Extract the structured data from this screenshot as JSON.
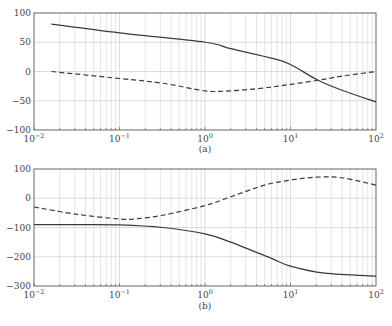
{
  "chart_data": [
    {
      "type": "line",
      "title": "",
      "caption": "(a)",
      "xlabel": "",
      "ylabel": "",
      "xscale": "log",
      "xlim": [
        0.01,
        100
      ],
      "ylim": [
        -100,
        100
      ],
      "grid": true,
      "x_tick_labels": [
        "10^-2",
        "10^-1",
        "10^0",
        "10^1",
        "10^2"
      ],
      "y_tick_labels": [
        "100",
        "50",
        "0",
        "-50",
        "-100"
      ],
      "y_ticks": [
        100,
        50,
        0,
        -50,
        -100
      ],
      "series": [
        {
          "name": "solid",
          "style": "solid",
          "x": [
            0.016,
            0.1,
            1,
            2,
            6.3,
            10,
            21,
            40,
            100
          ],
          "values": [
            81,
            66,
            50,
            39,
            22,
            12,
            -15,
            -32,
            -52
          ]
        },
        {
          "name": "dashed",
          "style": "dashed",
          "x": [
            0.016,
            0.1,
            0.32,
            1,
            2,
            5,
            10,
            21,
            40,
            100
          ],
          "values": [
            0,
            -12,
            -20,
            -33,
            -33,
            -28,
            -22,
            -15,
            -8,
            0
          ]
        }
      ]
    },
    {
      "type": "line",
      "title": "",
      "caption": "(b)",
      "xlabel": "",
      "ylabel": "",
      "xscale": "log",
      "xlim": [
        0.01,
        100
      ],
      "ylim": [
        -300,
        100
      ],
      "grid": true,
      "x_tick_labels": [
        "10^-2",
        "10^-1",
        "10^0",
        "10^1",
        "10^2"
      ],
      "y_tick_labels": [
        "100",
        "0",
        "-100",
        "-200",
        "-300"
      ],
      "y_ticks": [
        100,
        0,
        -100,
        -200,
        -300
      ],
      "series": [
        {
          "name": "solid",
          "style": "solid",
          "x": [
            0.01,
            0.032,
            0.1,
            0.32,
            1,
            2,
            5.8,
            10,
            25,
            100
          ],
          "values": [
            -90,
            -90,
            -91,
            -100,
            -122,
            -150,
            -204,
            -232,
            -256,
            -266
          ]
        },
        {
          "name": "dashed",
          "style": "dashed",
          "x": [
            0.01,
            0.032,
            0.1,
            0.16,
            0.32,
            1,
            2,
            5,
            10,
            20,
            40,
            100
          ],
          "values": [
            -30,
            -55,
            -71,
            -70,
            -58,
            -25,
            5,
            45,
            62,
            72,
            70,
            45
          ]
        }
      ]
    }
  ],
  "figure": {
    "caption_a": "(a)",
    "caption_b": "(b)",
    "colors": {
      "line": "#3a3a3a",
      "grid": "#d8d8d8",
      "frame": "#555555"
    }
  }
}
